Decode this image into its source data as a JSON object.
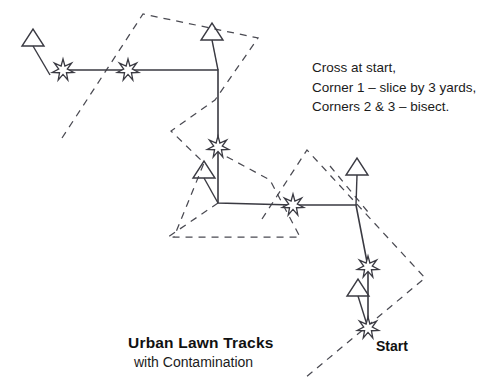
{
  "figure": {
    "title": "Urban Lawn Tracks",
    "subtitle": "with Contamination",
    "start_label": "Start",
    "notes": [
      "Cross at start,",
      "Corner 1 – slice by 3 yards,",
      "Corners 2 & 3 – bisect."
    ],
    "colors": {
      "stroke_solid": "#3a3a42",
      "stroke_dashed": "#4a4a52",
      "text": "#111111",
      "background": "#ffffff"
    },
    "solid_path": {
      "label": "traverse-route",
      "points": [
        [
          63,
          70
        ],
        [
          128,
          70
        ],
        [
          218,
          70
        ],
        [
          218,
          147
        ],
        [
          218,
          203
        ],
        [
          293,
          205
        ],
        [
          356,
          205
        ],
        [
          368,
          267
        ],
        [
          368,
          328
        ]
      ]
    },
    "markers": {
      "stars": [
        {
          "name": "star-leg-1-west",
          "x": 63,
          "y": 70,
          "r": 11
        },
        {
          "name": "star-leg-1-mid",
          "x": 128,
          "y": 70,
          "r": 11
        },
        {
          "name": "star-corner-1-vertical",
          "x": 218,
          "y": 147,
          "r": 11
        },
        {
          "name": "star-corner-2-horizontal",
          "x": 293,
          "y": 205,
          "r": 11
        },
        {
          "name": "star-leg-4-upper",
          "x": 368,
          "y": 267,
          "r": 11
        },
        {
          "name": "star-start",
          "x": 368,
          "y": 328,
          "r": 11
        }
      ],
      "triangles": [
        {
          "name": "triangle-flag-origin",
          "x": 22,
          "y": 46,
          "w": 22,
          "h": 17,
          "tail": [
            33,
            46,
            50,
            75
          ]
        },
        {
          "name": "triangle-flag-corner-1",
          "x": 201,
          "y": 40,
          "w": 22,
          "h": 17,
          "tail": [
            212,
            40,
            218,
            70
          ]
        },
        {
          "name": "triangle-flag-corner-2",
          "x": 193,
          "y": 178,
          "w": 22,
          "h": 17,
          "tail": [
            204,
            178,
            218,
            203
          ]
        },
        {
          "name": "triangle-flag-corner-3",
          "x": 346,
          "y": 175,
          "w": 22,
          "h": 17,
          "tail": [
            357,
            175,
            356,
            205
          ]
        },
        {
          "name": "triangle-flag-start",
          "x": 347,
          "y": 296,
          "w": 22,
          "h": 17,
          "tail": [
            358,
            296,
            368,
            328
          ]
        }
      ]
    },
    "dashed_shapes": [
      {
        "name": "dashed-polygon-upper",
        "closed": false,
        "points": [
          [
            62,
            138
          ],
          [
            143,
            14
          ],
          [
            258,
            38
          ],
          [
            215,
            100
          ],
          [
            171,
            131
          ],
          [
            204,
            163
          ],
          [
            174,
            237
          ]
        ]
      },
      {
        "name": "dashed-triangle-lower-left",
        "closed": false,
        "points": [
          [
            218,
            203
          ],
          [
            168,
            237
          ],
          [
            300,
            237
          ],
          [
            270,
            180
          ],
          [
            218,
            152
          ]
        ]
      },
      {
        "name": "dashed-polygon-right",
        "closed": false,
        "points": [
          [
            262,
            219
          ],
          [
            307,
            150
          ],
          [
            425,
            278
          ],
          [
            305,
            378
          ]
        ]
      },
      {
        "name": "dashed-edge-corner-3",
        "closed": false,
        "points": [
          [
            330,
            166
          ],
          [
            368,
            212
          ]
        ]
      }
    ]
  }
}
